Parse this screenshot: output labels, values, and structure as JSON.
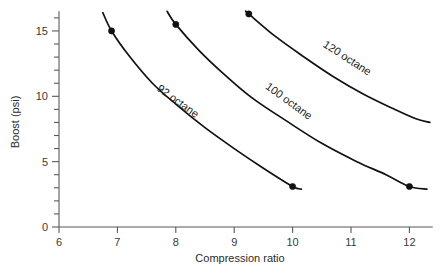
{
  "chart_data": {
    "type": "line",
    "title": "",
    "xlabel": "Compression ratio",
    "ylabel": "Boost (psi)",
    "xlim": [
      6,
      12.4
    ],
    "ylim": [
      0,
      16.5
    ],
    "xticks": [
      6,
      7,
      8,
      9,
      10,
      11,
      12
    ],
    "xtick_labels": [
      "6",
      "7",
      "8",
      "9",
      "10",
      "11",
      "12"
    ],
    "yticks": [
      0,
      5,
      10,
      15
    ],
    "ytick_labels": [
      "0",
      "5",
      "10",
      "15"
    ],
    "y_minor_step": 1,
    "grid": false,
    "legend": "inline-curve-labels",
    "series": [
      {
        "name": "92 octane",
        "label": "92 octane",
        "label_x": 8.0,
        "label_y": 9.4,
        "label_rotation": 36,
        "x": [
          6.75,
          6.9,
          7.2,
          7.6,
          8.0,
          8.5,
          9.0,
          9.5,
          10.0,
          10.15
        ],
        "y": [
          16.4,
          15.0,
          13.1,
          11.0,
          9.4,
          7.6,
          6.0,
          4.5,
          3.1,
          2.9
        ],
        "markers": [
          {
            "x": 6.9,
            "y": 15.0
          },
          {
            "x": 10.0,
            "y": 3.1
          }
        ]
      },
      {
        "name": "100 octane",
        "label": "100 octane",
        "label_x": 9.9,
        "label_y": 9.4,
        "label_rotation": 36,
        "x": [
          7.85,
          8.0,
          8.4,
          8.8,
          9.3,
          9.9,
          10.5,
          11.1,
          11.6,
          12.0,
          12.3
        ],
        "y": [
          16.5,
          15.5,
          13.5,
          11.8,
          9.9,
          8.1,
          6.4,
          5.0,
          4.0,
          3.1,
          2.9
        ],
        "markers": [
          {
            "x": 8.0,
            "y": 15.5
          },
          {
            "x": 12.0,
            "y": 3.1
          }
        ]
      },
      {
        "name": "120 octane",
        "label": "120 octane",
        "label_x": 10.9,
        "label_y": 12.7,
        "label_rotation": 33,
        "x": [
          9.2,
          9.25,
          9.7,
          10.2,
          10.7,
          11.2,
          11.7,
          12.1,
          12.35
        ],
        "y": [
          16.5,
          16.3,
          14.6,
          13.0,
          11.5,
          10.2,
          9.1,
          8.3,
          8.0
        ],
        "markers": [
          {
            "x": 9.25,
            "y": 16.3
          }
        ]
      }
    ],
    "colors": {
      "curve": "#111111",
      "axis": "#595959",
      "text": "#2b2b2b",
      "background": "#ffffff"
    }
  }
}
